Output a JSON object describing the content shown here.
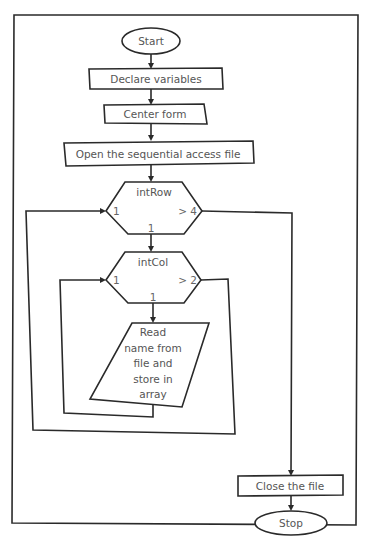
{
  "diagram": {
    "type": "flowchart",
    "colors": {
      "line": "#2a2a2a",
      "text": "#555555",
      "background": "#ffffff"
    },
    "nodes": {
      "start": {
        "shape": "oval",
        "label": "Start"
      },
      "declare": {
        "shape": "process",
        "label": "Declare variables"
      },
      "center": {
        "shape": "process",
        "label": "Center form"
      },
      "open": {
        "shape": "process",
        "label": "Open the sequential access file"
      },
      "loop_row": {
        "shape": "loop-hexagon",
        "label": "intRow",
        "start_value": "1",
        "limit": "> 4",
        "step": "1"
      },
      "loop_col": {
        "shape": "loop-hexagon",
        "label": "intCol",
        "start_value": "1",
        "limit": "> 2",
        "step": "1"
      },
      "read": {
        "shape": "input-output",
        "label_lines": [
          "Read",
          "name from",
          "file and",
          "store in",
          "array"
        ]
      },
      "close": {
        "shape": "process",
        "label": "Close the file"
      },
      "stop": {
        "shape": "oval",
        "label": "Stop"
      }
    },
    "edges": [
      {
        "from": "start",
        "to": "declare"
      },
      {
        "from": "declare",
        "to": "center"
      },
      {
        "from": "center",
        "to": "open"
      },
      {
        "from": "open",
        "to": "loop_row"
      },
      {
        "from": "loop_row",
        "to": "loop_col",
        "label": "1"
      },
      {
        "from": "loop_col",
        "to": "read",
        "label": "1"
      },
      {
        "from": "read",
        "to": "loop_col",
        "label": "loop back"
      },
      {
        "from": "loop_col",
        "to": "loop_row",
        "label": "> 2 exit, loop back"
      },
      {
        "from": "loop_row",
        "to": "close",
        "label": "> 4 exit"
      },
      {
        "from": "close",
        "to": "stop"
      }
    ]
  }
}
